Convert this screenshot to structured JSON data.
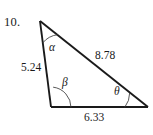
{
  "figure": {
    "problem_number": "10.",
    "background_color": "#ffffff",
    "stroke_color": "#1a1a1a",
    "triangle": {
      "vertices": {
        "apex": {
          "name": "top-vertex",
          "x": 40,
          "y": 21
        },
        "bottom_left": {
          "name": "bottom-left-vertex",
          "x": 51,
          "y": 107
        },
        "bottom_right": {
          "name": "bottom-right-vertex",
          "x": 148,
          "y": 107
        }
      },
      "sides": [
        {
          "id": "left",
          "label": "5.24",
          "from": "apex",
          "to": "bottom_left"
        },
        {
          "id": "hypotenuse",
          "label": "8.78",
          "from": "apex",
          "to": "bottom_right"
        },
        {
          "id": "base",
          "label": "6.33",
          "from": "bottom_left",
          "to": "bottom_right"
        }
      ],
      "angles": [
        {
          "id": "alpha",
          "label": "α",
          "at": "apex",
          "arc_radius": 22
        },
        {
          "id": "beta",
          "label": "β",
          "at": "bottom_left",
          "arc_radius": 20
        },
        {
          "id": "theta",
          "label": "θ",
          "at": "bottom_right",
          "arc_radius": 23
        }
      ]
    }
  }
}
